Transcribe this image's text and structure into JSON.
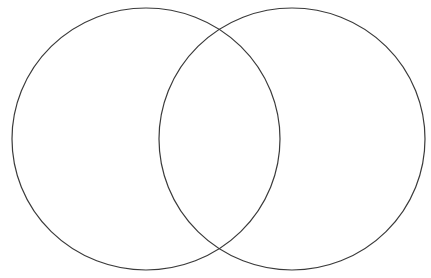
{
  "diagram": {
    "type": "venn",
    "background": "#ffffff",
    "stroke_color": "#3a3a3a",
    "stroke_width": 1.2,
    "sets": [
      {
        "id": "left-set",
        "label": "",
        "cx": 146,
        "cy": 139,
        "rx": 134,
        "ry": 131
      },
      {
        "id": "right-set",
        "label": "",
        "cx": 292,
        "cy": 139,
        "rx": 133,
        "ry": 131
      }
    ],
    "intersection_label": ""
  }
}
